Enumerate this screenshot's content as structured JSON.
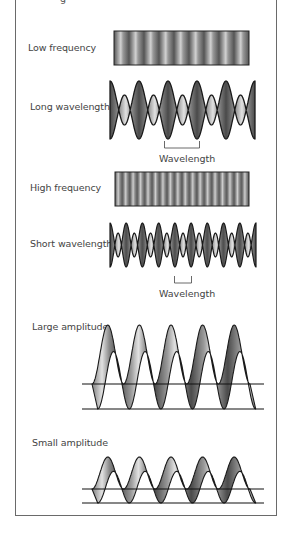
{
  "figure": {
    "top_cut_text": "g",
    "sections": [
      {
        "id": "low-frequency",
        "label": "Low frequency",
        "kind": "stripe-bar",
        "stripes": 9
      },
      {
        "id": "long-wavelength",
        "label": "Long wavelength",
        "kind": "wave-ribbon",
        "cycles": 5,
        "caption": "Wavelength"
      },
      {
        "id": "high-frequency",
        "label": "High frequency",
        "kind": "stripe-bar",
        "stripes": 18
      },
      {
        "id": "short-wavelength",
        "label": "Short wavelength",
        "kind": "wave-ribbon",
        "cycles": 9,
        "caption": "Wavelength"
      },
      {
        "id": "large-amplitude",
        "label": "Large amplitude",
        "kind": "perspective-wave",
        "cycles": 5
      },
      {
        "id": "small-amplitude",
        "label": "Small amplitude",
        "kind": "perspective-wave",
        "cycles": 5
      }
    ],
    "colors": {
      "frame": "#6a6a6a",
      "outline": "#1a1a1a",
      "dark": "#3c3c3c",
      "light": "#d8d8d8",
      "text": "#444444"
    }
  }
}
